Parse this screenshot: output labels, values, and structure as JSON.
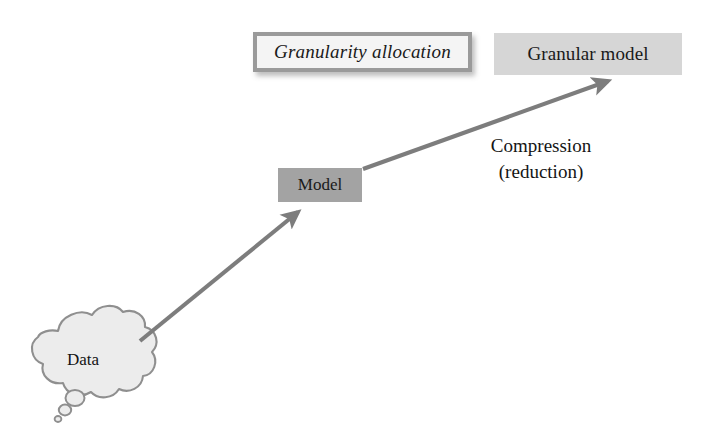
{
  "diagram": {
    "background_color": "#ffffff",
    "nodes": {
      "data_cloud": {
        "label": "Data",
        "shape": "thought-cloud",
        "fill_color": "#ececec",
        "stroke_color": "#8f8f8f"
      },
      "model": {
        "label": "Model",
        "shape": "rectangle",
        "fill_color": "#a3a3a3",
        "text_color": "#1a1a1a"
      },
      "granularity_allocation": {
        "label": "Granularity allocation",
        "shape": "rectangle",
        "style": "italic",
        "fill_color": "#f4f4f4",
        "border_color": "#9a9a9a",
        "has_shadow": true
      },
      "granular_model": {
        "label": "Granular model",
        "shape": "rectangle",
        "fill_color": "#d6d6d6",
        "text_color": "#1a1a1a"
      }
    },
    "edges": [
      {
        "name": "data-to-model-arrow",
        "from": "data_cloud",
        "to": "model",
        "label": "",
        "color": "#7d7d7d",
        "arrowhead": "solid-triangle"
      },
      {
        "name": "model-to-granular-model-arrow",
        "from": "model",
        "to": "granular_model",
        "label": "Compression\n(reduction)",
        "color": "#7d7d7d",
        "arrowhead": "solid-triangle"
      }
    ],
    "annotations": {
      "compression_label": "Compression\n(reduction)"
    }
  }
}
